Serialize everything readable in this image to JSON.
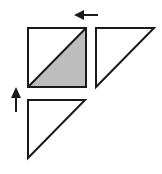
{
  "diagram": {
    "colors": {
      "stroke": "#1a1a1a",
      "shaded_fill": "#bdbdbd",
      "empty_fill": "#ffffff",
      "background": "#ffffff"
    },
    "square": {
      "x": 28,
      "y": 28,
      "size": 58
    },
    "shaded_triangle": {
      "points": "28,87 86,28 86,87"
    },
    "right_triangle": {
      "points": "96,28 154,28 96,87"
    },
    "bottom_triangle": {
      "points": "28,100 85,100 28,158"
    },
    "arrows": [
      {
        "name": "left-arrow",
        "direction": "left",
        "from": [
          98,
          15
        ],
        "to": [
          75,
          15
        ]
      },
      {
        "name": "up-arrow",
        "direction": "up",
        "from": [
          16,
          112
        ],
        "to": [
          16,
          88
        ]
      }
    ]
  }
}
